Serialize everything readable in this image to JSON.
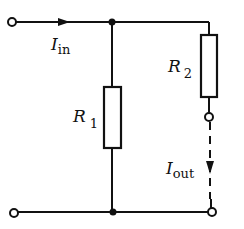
{
  "diagram": {
    "colors": {
      "stroke": "#111111",
      "background": "#ffffff"
    },
    "labels": {
      "i_in": {
        "main": "I",
        "sub": "in"
      },
      "r1": {
        "main": "R",
        "sub": "1"
      },
      "r2": {
        "main": "R",
        "sub": "2"
      },
      "i_out": {
        "main": "I",
        "sub": "out"
      }
    },
    "components": [
      {
        "id": "R1",
        "type": "resistor",
        "orientation": "vertical",
        "position": "middle branch"
      },
      {
        "id": "R2",
        "type": "resistor",
        "orientation": "vertical",
        "position": "right branch"
      }
    ],
    "terminals": [
      "top-left input",
      "bottom-left input",
      "R2 output",
      "bottom-right output"
    ],
    "junctions": [
      "top middle",
      "bottom middle"
    ],
    "currents": [
      {
        "name": "I_in",
        "direction": "right",
        "wire": "top"
      },
      {
        "name": "I_out",
        "direction": "down",
        "style": "dashed",
        "wire": "right output"
      }
    ]
  }
}
